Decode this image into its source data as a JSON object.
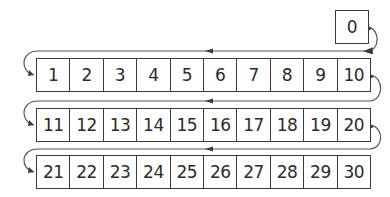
{
  "diagram": {
    "type": "number-path",
    "start": {
      "value": "0"
    },
    "rows": [
      [
        "1",
        "2",
        "3",
        "4",
        "5",
        "6",
        "7",
        "8",
        "9",
        "10"
      ],
      [
        "11",
        "12",
        "13",
        "14",
        "15",
        "16",
        "17",
        "18",
        "19",
        "20"
      ],
      [
        "21",
        "22",
        "23",
        "24",
        "25",
        "26",
        "27",
        "28",
        "29",
        "30"
      ]
    ],
    "colors": {
      "line": "#3a3a3a",
      "text": "#2b2b2b",
      "background": "#ffffff"
    }
  }
}
